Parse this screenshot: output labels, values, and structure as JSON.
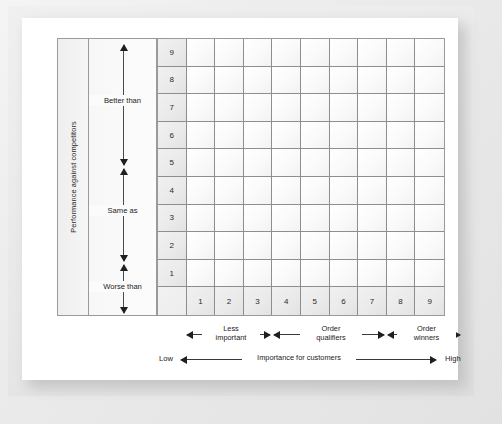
{
  "chart_data": {
    "type": "table",
    "xlabel": "Importance for customers",
    "ylabel": "Performance against competitors",
    "x_ticks": [
      "1",
      "2",
      "3",
      "4",
      "5",
      "6",
      "7",
      "8",
      "9"
    ],
    "y_ticks": [
      "9",
      "8",
      "7",
      "6",
      "5",
      "4",
      "3",
      "2",
      "1"
    ],
    "xlim": [
      1,
      9
    ],
    "ylim": [
      1,
      9
    ],
    "grid": true,
    "legend": null,
    "annotations": [
      "Better than",
      "Same as",
      "Worse than",
      "Less important",
      "Order qualifiers",
      "Order winners",
      "Low",
      "High"
    ]
  },
  "vertical_axis": {
    "title": "Performance against competitors",
    "bands": [
      {
        "label": "Better than",
        "rows": 3
      },
      {
        "label": "Same as",
        "rows": 3
      },
      {
        "label": "Worse than",
        "rows": 3
      }
    ],
    "scale": [
      "9",
      "8",
      "7",
      "6",
      "5",
      "4",
      "3",
      "2",
      "1"
    ]
  },
  "horizontal_axis": {
    "title": "Importance for customers",
    "low_label": "Low",
    "high_label": "High",
    "bands": [
      {
        "label_line1": "Less",
        "label_line2": "important"
      },
      {
        "label_line1": "Order",
        "label_line2": "qualifiers"
      },
      {
        "label_line1": "Order",
        "label_line2": "winners"
      }
    ],
    "scale": [
      "1",
      "2",
      "3",
      "4",
      "5",
      "6",
      "7",
      "8",
      "9"
    ]
  },
  "grid": {
    "rows": 10,
    "cols": 10,
    "row_headers": [
      "9",
      "8",
      "7",
      "6",
      "5",
      "4",
      "3",
      "2",
      "1",
      ""
    ],
    "col_headers": [
      "",
      "1",
      "2",
      "3",
      "4",
      "5",
      "6",
      "7",
      "8",
      "9"
    ]
  },
  "colors": {
    "grid_line": "#8e8e8e",
    "frame": "#9a9a9a",
    "arrow": "#1f1f1f",
    "text": "#222222",
    "header_fill": "#eaeaea",
    "cell_fill": "#fafafa",
    "card": "#ffffff",
    "mat": "#ebebeb"
  }
}
